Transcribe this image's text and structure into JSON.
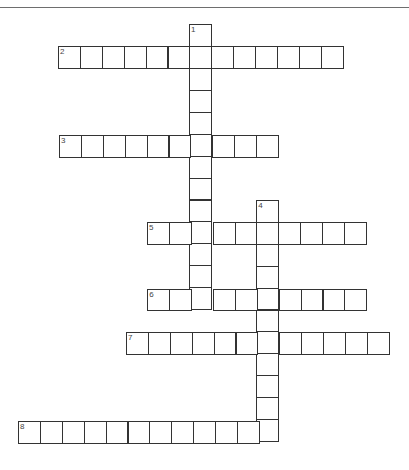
{
  "puzzle": {
    "type": "crossword",
    "cell_size": 21.9,
    "colors": {
      "border": "#333333",
      "rule": "#6e6e6e",
      "background": "#ffffff",
      "number": "#444444"
    },
    "entries": [
      {
        "number": "1",
        "direction": "down",
        "x": 189,
        "y": 24.3,
        "length": 13
      },
      {
        "number": "2",
        "direction": "across",
        "x": 58,
        "y": 45.8,
        "length": 13
      },
      {
        "number": "3",
        "direction": "across",
        "x": 59,
        "y": 134.8,
        "length": 10
      },
      {
        "number": "4",
        "direction": "down",
        "x": 256.2,
        "y": 200,
        "length": 11
      },
      {
        "number": "5",
        "direction": "across",
        "x": 147,
        "y": 222,
        "length": 10
      },
      {
        "number": "6",
        "direction": "across",
        "x": 147.3,
        "y": 288.5,
        "length": 10
      },
      {
        "number": "7",
        "direction": "across",
        "x": 126,
        "y": 332,
        "length": 12
      },
      {
        "number": "8",
        "direction": "across",
        "x": 18,
        "y": 421,
        "length": 12
      }
    ]
  }
}
